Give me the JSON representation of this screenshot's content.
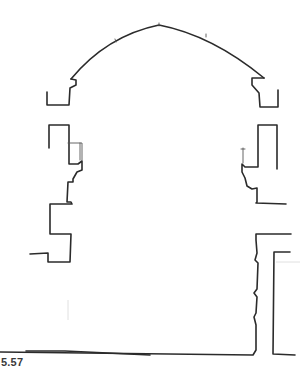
{
  "figure": {
    "label": "5.57",
    "ink_color": "#2b2b2b",
    "background": "#ffffff"
  }
}
